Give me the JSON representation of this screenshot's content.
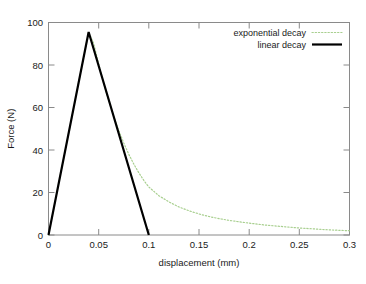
{
  "chart_data": {
    "type": "line",
    "title": "",
    "xlabel": "displacement (mm)",
    "ylabel": "Force (N)",
    "xlim": [
      0,
      0.3
    ],
    "ylim": [
      0,
      100
    ],
    "grid": false,
    "legend_position": "top-right-inside",
    "xticks": [
      "0",
      "0.05",
      "0.1",
      "0.15",
      "0.2",
      "0.25",
      "0.3"
    ],
    "xtick_values": [
      0,
      0.05,
      0.1,
      0.15,
      0.2,
      0.25,
      0.3
    ],
    "yticks": [
      "0",
      "20",
      "40",
      "60",
      "80",
      "100"
    ],
    "ytick_values": [
      0,
      20,
      40,
      60,
      80,
      100
    ],
    "series": [
      {
        "name": "exponential decay",
        "style": "dotted",
        "color": "#a8cf8f",
        "x": [
          0,
          0.004,
          0.008,
          0.012,
          0.016,
          0.02,
          0.024,
          0.028,
          0.032,
          0.036,
          0.04,
          0.045,
          0.05,
          0.055,
          0.06,
          0.065,
          0.07,
          0.075,
          0.08,
          0.085,
          0.09,
          0.095,
          0.1,
          0.11,
          0.12,
          0.13,
          0.14,
          0.15,
          0.16,
          0.17,
          0.18,
          0.19,
          0.2,
          0.21,
          0.22,
          0.23,
          0.24,
          0.25,
          0.26,
          0.27,
          0.28,
          0.29,
          0.3
        ],
        "y": [
          0,
          9.6,
          19.1,
          28.7,
          38.2,
          47.8,
          57.3,
          66.9,
          76.4,
          86.0,
          95.5,
          90.2,
          80.5,
          71.4,
          63.2,
          55.8,
          49.2,
          43.3,
          38.0,
          33.4,
          29.3,
          25.7,
          22.6,
          18.5,
          15.6,
          13.2,
          11.4,
          9.9,
          8.7,
          7.7,
          6.9,
          6.2,
          5.6,
          5.0,
          4.5,
          4.1,
          3.7,
          3.3,
          3.0,
          2.7,
          2.4,
          2.2,
          2.0
        ]
      },
      {
        "name": "linear decay",
        "style": "solid",
        "color": "#000000",
        "x": [
          0,
          0.04,
          0.1
        ],
        "y": [
          0,
          95.5,
          0
        ]
      }
    ],
    "annotations": {
      "peak_displacement_mm": 0.04,
      "peak_force_N": 95.5,
      "linear_end_displacement_mm": 0.1
    }
  },
  "legend": {
    "entries": [
      {
        "label": "exponential decay",
        "sample": "dotted-green-line"
      },
      {
        "label": "linear decay",
        "sample": "solid-black-line"
      }
    ]
  }
}
